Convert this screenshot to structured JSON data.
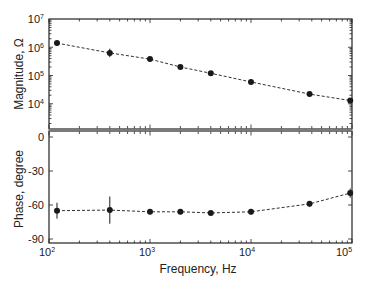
{
  "chart_data": [
    {
      "panel": "top",
      "type": "scatter",
      "title": "",
      "xlabel": "Frequency, Hz",
      "ylabel": "Magnitude, Ω",
      "xscale": "log",
      "yscale": "log",
      "xlim": [
        100,
        100000
      ],
      "ylim": [
        1000,
        10000000
      ],
      "y_tick_labels": [
        "10^7",
        "10^6",
        "10^5",
        "10^4"
      ],
      "y_ticks": [
        10000000,
        1000000,
        100000,
        10000
      ],
      "grid": false,
      "legend": null,
      "line_style": "dashed",
      "marker": "filled-circle",
      "error_bars": true,
      "series": [
        {
          "name": "Magnitude",
          "x": [
            120,
            400,
            1000,
            2000,
            4000,
            10000,
            38000,
            96000
          ],
          "y": [
            1400000,
            630000,
            380000,
            200000,
            120000,
            59000,
            22000,
            13000
          ],
          "yerr_log": [
            0.08,
            0.15,
            0.06,
            0.05,
            0.05,
            0.05,
            0.05,
            0.05
          ]
        }
      ]
    },
    {
      "panel": "bottom",
      "type": "scatter",
      "title": "",
      "xlabel": "Frequency, Hz",
      "ylabel": "Phase, degree",
      "xscale": "log",
      "yscale": "linear",
      "xlim": [
        100,
        100000
      ],
      "ylim": [
        -95,
        5
      ],
      "x_tick_labels": [
        "10^2",
        "10^3",
        "10^4",
        "10^5"
      ],
      "x_ticks": [
        100,
        1000,
        10000,
        100000
      ],
      "y_tick_labels": [
        "0",
        "-30",
        "-60",
        "-90"
      ],
      "y_ticks": [
        0,
        -30,
        -60,
        -90
      ],
      "grid": false,
      "legend": null,
      "line_style": "dashed",
      "marker": "filled-circle",
      "error_bars": true,
      "series": [
        {
          "name": "Phase",
          "x": [
            120,
            400,
            1000,
            2000,
            4000,
            10000,
            38000,
            96000
          ],
          "y": [
            -65,
            -64.5,
            -66,
            -66,
            -67,
            -66,
            -59,
            -49.5
          ],
          "yerr": [
            7,
            12,
            2,
            2,
            2,
            2.5,
            2.5,
            4
          ]
        }
      ]
    }
  ],
  "labels": {
    "x_axis_title": "Frequency, Hz",
    "top_y_title": "Magnitude, Ω",
    "bottom_y_title": "Phase, degree",
    "x_ticks": [
      {
        "base": "10",
        "exp": "2"
      },
      {
        "base": "10",
        "exp": "3"
      },
      {
        "base": "10",
        "exp": "4"
      },
      {
        "base": "10",
        "exp": "5"
      }
    ],
    "top_y_ticks": [
      {
        "base": "10",
        "exp": "7"
      },
      {
        "base": "10",
        "exp": "6"
      },
      {
        "base": "10",
        "exp": "5"
      },
      {
        "base": "10",
        "exp": "4"
      }
    ],
    "bottom_y_ticks": [
      "0",
      "-30",
      "-60",
      "-90"
    ]
  },
  "colors": {
    "axis": "#222222",
    "data": "#1a1a1a",
    "divider": "#7a7a7a",
    "background": "#ffffff"
  }
}
